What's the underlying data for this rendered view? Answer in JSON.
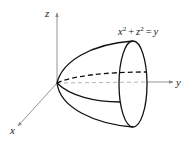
{
  "diagram": {
    "equation": {
      "x_term": "x",
      "z_term": "z",
      "exponent": "2",
      "plus": "+",
      "equals": "=",
      "rhs": "y"
    },
    "axes": {
      "x_label": "x",
      "y_label": "y",
      "z_label": "z"
    },
    "colors": {
      "axis": "#888888",
      "surface": "#111111",
      "text": "#222222"
    }
  }
}
